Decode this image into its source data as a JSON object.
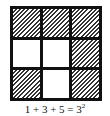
{
  "figure": {
    "grid": {
      "rows": 3,
      "cols": 3,
      "cells": [
        [
          "hatched",
          "hatched",
          "hatched"
        ],
        [
          "white",
          "white",
          "hatched"
        ],
        [
          "hatched",
          "white",
          "hatched"
        ]
      ]
    },
    "caption": {
      "text": "1 + 3 + 5 = 3",
      "exponent": "2"
    }
  }
}
